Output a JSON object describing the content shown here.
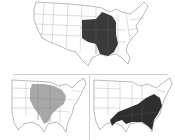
{
  "figure": {
    "panels": [
      {
        "id": "top",
        "description": "US map with dark shaded central Mississippi valley / Midwest region",
        "shade_color": "#3a3a3a"
      },
      {
        "id": "bottom-left",
        "description": "US eastern map with light gray shaded Midwest / Ohio valley region",
        "shade_color": "#a8a8a8"
      },
      {
        "id": "bottom-right",
        "description": "US eastern map with dark shaded Southeast region",
        "shade_color": "#2e2e2e"
      }
    ],
    "colors": {
      "background": "#ffffff",
      "outline": "#9a9a9a",
      "divider": "#cfcfcf"
    }
  }
}
